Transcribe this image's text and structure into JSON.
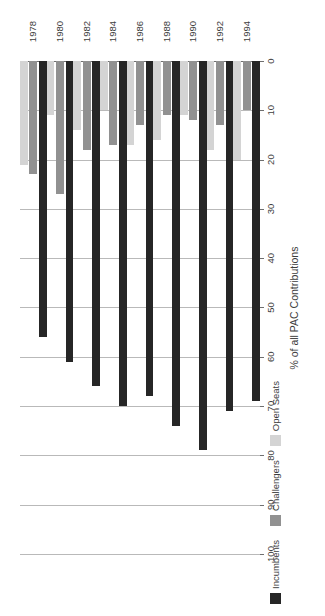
{
  "chart_data": {
    "type": "bar",
    "orientation": "horizontal-rotated",
    "title": "",
    "xlabel": "",
    "ylabel": "% of all PAC Contributions",
    "ylim": [
      0,
      100
    ],
    "yticks": [
      0,
      10,
      20,
      30,
      40,
      50,
      60,
      70,
      80,
      90,
      100
    ],
    "ytick_labels": [
      "0",
      "10",
      "20",
      "30",
      "40",
      "50",
      "60",
      "70",
      "80",
      "90",
      "100"
    ],
    "grid": true,
    "legend_position": "left",
    "categories": [
      "1978",
      "1980",
      "1982",
      "1984",
      "1986",
      "1988",
      "1990",
      "1992",
      "1994"
    ],
    "series": [
      {
        "name": "Incumbents",
        "color": "#262626",
        "values": [
          56,
          61,
          66,
          70,
          68,
          74,
          79,
          71,
          69
        ]
      },
      {
        "name": "Challengers",
        "color": "#919191",
        "values": [
          23,
          27,
          18,
          17,
          13,
          11,
          12,
          13,
          10
        ]
      },
      {
        "name": "Open Seats",
        "color": "#d4d4d4",
        "values": [
          21,
          11,
          14,
          10,
          17,
          16,
          11,
          18,
          20
        ]
      }
    ]
  },
  "axis": {
    "value_axis_title": "% of all PAC Contributions"
  },
  "legend": {
    "items": [
      {
        "label": "Incumbents",
        "color": "#262626"
      },
      {
        "label": "Challengers",
        "color": "#919191"
      },
      {
        "label": "Open Seats",
        "color": "#d4d4d4"
      }
    ]
  },
  "colors": {
    "incumbents": "#262626",
    "challengers": "#919191",
    "open_seats": "#d4d4d4",
    "gridline": "#b9b9b9",
    "axis": "#6f6f6f",
    "background": "#ffffff",
    "text": "#3d3d3d"
  }
}
